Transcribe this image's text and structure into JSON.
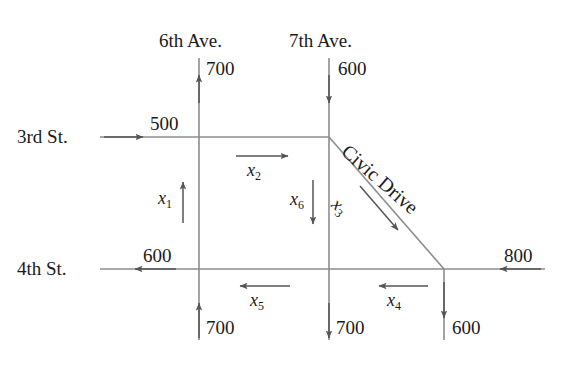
{
  "diagram": {
    "line_color": "#808080",
    "text_color": "#1a1a1a",
    "streets": {
      "third_st": "3rd St.",
      "fourth_st": "4th St.",
      "sixth_ave": "6th Ave.",
      "seventh_ave": "7th Ave.",
      "civic_drive": "Civic Drive"
    },
    "flows": {
      "sixth_ave_top": "700",
      "seventh_ave_top": "600",
      "third_st_left": "500",
      "fourth_st_left": "600",
      "fourth_st_right": "800",
      "sixth_ave_bottom": "700",
      "seventh_ave_bottom": "700",
      "civic_bottom": "600"
    },
    "variables": {
      "x1": {
        "base": "x",
        "sub": "1"
      },
      "x2": {
        "base": "x",
        "sub": "2"
      },
      "x3": {
        "base": "x",
        "sub": "3"
      },
      "x4": {
        "base": "x",
        "sub": "4"
      },
      "x5": {
        "base": "x",
        "sub": "5"
      },
      "x6": {
        "base": "x",
        "sub": "6"
      }
    }
  }
}
